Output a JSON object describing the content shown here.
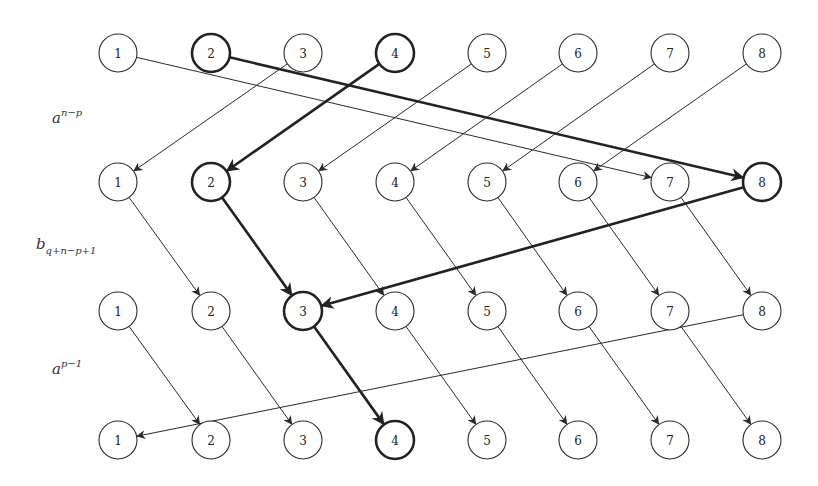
{
  "diagram": {
    "columns": [
      "1",
      "2",
      "3",
      "4",
      "5",
      "6",
      "7",
      "8"
    ],
    "rows": [
      {
        "id": "r0",
        "highlighted": [
          "2",
          "4"
        ],
        "shading": "lines"
      },
      {
        "id": "r1",
        "highlighted": [
          "2",
          "8"
        ],
        "shading": "lines"
      },
      {
        "id": "r2",
        "highlighted": [
          "3"
        ],
        "shading": "grid"
      },
      {
        "id": "r3",
        "highlighted": [
          "4"
        ],
        "shading": "grid"
      }
    ],
    "row_labels": [
      {
        "between": [
          0,
          1
        ],
        "base": "a",
        "sup": "n−p",
        "sub": ""
      },
      {
        "between": [
          1,
          2
        ],
        "base": "b",
        "sup": "",
        "sub": "q+n−p+1"
      },
      {
        "between": [
          2,
          3
        ],
        "base": "a",
        "sup": "p−1",
        "sub": ""
      }
    ],
    "mappings": [
      {
        "from_row": 0,
        "to_row": 1,
        "edges": [
          {
            "from": "1",
            "to": "7",
            "bold": false
          },
          {
            "from": "2",
            "to": "8",
            "bold": true
          },
          {
            "from": "3",
            "to": "1",
            "bold": false
          },
          {
            "from": "4",
            "to": "2",
            "bold": true
          },
          {
            "from": "5",
            "to": "3",
            "bold": false
          },
          {
            "from": "6",
            "to": "4",
            "bold": false
          },
          {
            "from": "7",
            "to": "5",
            "bold": false
          },
          {
            "from": "8",
            "to": "6",
            "bold": false
          }
        ]
      },
      {
        "from_row": 1,
        "to_row": 2,
        "edges": [
          {
            "from": "1",
            "to": "2",
            "bold": false
          },
          {
            "from": "2",
            "to": "3",
            "bold": true
          },
          {
            "from": "3",
            "to": "4",
            "bold": false
          },
          {
            "from": "4",
            "to": "5",
            "bold": false
          },
          {
            "from": "5",
            "to": "6",
            "bold": false
          },
          {
            "from": "6",
            "to": "7",
            "bold": false
          },
          {
            "from": "7",
            "to": "8",
            "bold": false
          },
          {
            "from": "8",
            "to": "3",
            "bold": true
          }
        ]
      },
      {
        "from_row": 2,
        "to_row": 3,
        "edges": [
          {
            "from": "1",
            "to": "2",
            "bold": false
          },
          {
            "from": "2",
            "to": "3",
            "bold": false
          },
          {
            "from": "3",
            "to": "4",
            "bold": true
          },
          {
            "from": "4",
            "to": "5",
            "bold": false
          },
          {
            "from": "5",
            "to": "6",
            "bold": false
          },
          {
            "from": "6",
            "to": "7",
            "bold": false
          },
          {
            "from": "7",
            "to": "8",
            "bold": false
          },
          {
            "from": "8",
            "to": "1",
            "bold": false
          }
        ]
      }
    ],
    "colors": {
      "stroke": "#2a2a2a",
      "highlight_fill": "#d8d8d8",
      "background": "#ffffff"
    }
  }
}
